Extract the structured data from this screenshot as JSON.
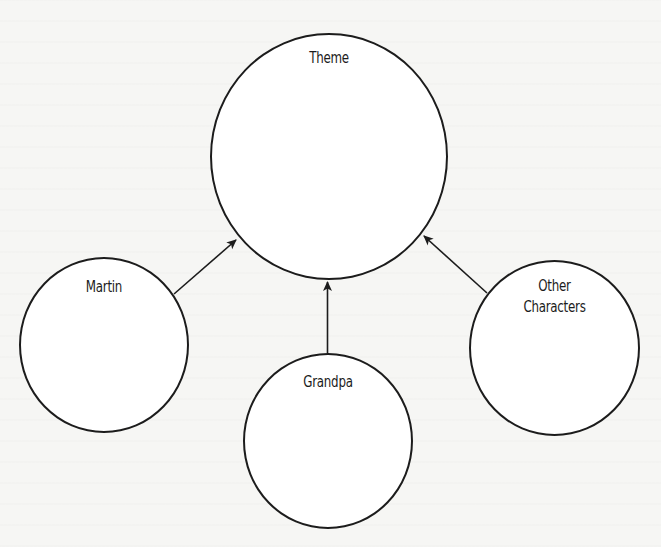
{
  "diagram": {
    "type": "concept-web",
    "center_node": {
      "id": "theme",
      "label": "Theme"
    },
    "nodes": [
      {
        "id": "martin",
        "label": "Martin"
      },
      {
        "id": "grandpa",
        "label": "Grandpa"
      },
      {
        "id": "other",
        "label_line1": "Other",
        "label_line2": "Characters"
      }
    ],
    "edges": [
      {
        "from": "martin",
        "to": "theme",
        "style": "arrow"
      },
      {
        "from": "grandpa",
        "to": "theme",
        "style": "arrow"
      },
      {
        "from": "other",
        "to": "theme",
        "style": "arrow"
      }
    ],
    "colors": {
      "stroke": "#1c1c1c",
      "background": "#f6f6f4",
      "node_fill": "#ffffff"
    }
  }
}
